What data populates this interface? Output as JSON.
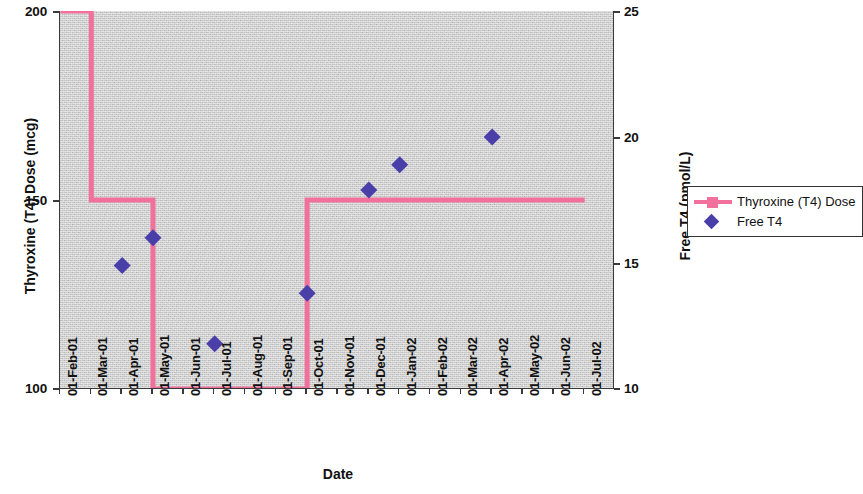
{
  "chart_data": {
    "type": "line",
    "title": "",
    "xlabel": "Date",
    "ylabel_left": "Thyroxine (T4) Dose (mcg)",
    "ylabel_right": "Free T4 (pmol/L)",
    "grid": false,
    "legend_position": "right",
    "x_categories": [
      "01-Feb-01",
      "01-Mar-01",
      "01-Apr-01",
      "01-May-01",
      "01-Jun-01",
      "01-Jul-01",
      "01-Aug-01",
      "01-Sep-01",
      "01-Oct-01",
      "01-Nov-01",
      "01-Dec-01",
      "01-Jan-02",
      "01-Feb-02",
      "01-Mar-02",
      "01-Apr-02",
      "01-May-02",
      "01-Jun-02",
      "01-Jul-02"
    ],
    "y_left_ticks": [
      "100",
      "150",
      "200"
    ],
    "y_left_lim": [
      100,
      200
    ],
    "y_right_ticks": [
      "10",
      "15",
      "20",
      "25"
    ],
    "y_right_lim": [
      10,
      25
    ],
    "series": [
      {
        "name": "Thyroxine (T4) Dose",
        "type": "step",
        "axis": "left",
        "color": "#f2719c",
        "units": "mcg",
        "points": [
          {
            "x": "01-Feb-01",
            "y": 200
          },
          {
            "x": "01-Mar-01",
            "y": 200
          },
          {
            "x": "01-Mar-01",
            "y": 150
          },
          {
            "x": "01-May-01",
            "y": 150
          },
          {
            "x": "01-May-01",
            "y": 100
          },
          {
            "x": "01-Oct-01",
            "y": 100
          },
          {
            "x": "01-Oct-01",
            "y": 150
          },
          {
            "x": "01-Jul-02",
            "y": 150
          }
        ]
      },
      {
        "name": "Free T4",
        "type": "scatter",
        "axis": "right",
        "color": "#4a3fa8",
        "units": "pmol/L",
        "points": [
          {
            "x": "01-Apr-01",
            "y": 14.9
          },
          {
            "x": "01-May-01",
            "y": 16.0
          },
          {
            "x": "01-Jul-01",
            "y": 11.8
          },
          {
            "x": "01-Oct-01",
            "y": 13.8
          },
          {
            "x": "01-Dec-01",
            "y": 17.9
          },
          {
            "x": "01-Jan-02",
            "y": 18.9
          },
          {
            "x": "01-Apr-02",
            "y": 20.0
          }
        ]
      }
    ],
    "legend_entries": [
      {
        "label": "Thyroxine (T4) Dose",
        "marker": "line-square",
        "color": "#f2719c"
      },
      {
        "label": "Free T4",
        "marker": "diamond",
        "color": "#4a3fa8"
      }
    ]
  }
}
